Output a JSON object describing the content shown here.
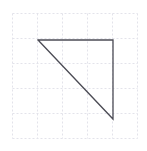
{
  "figure": {
    "canvas": {
      "width": 147,
      "height": 151,
      "background_color": "#ffffff"
    },
    "grid": {
      "visible": true,
      "style": "dashed",
      "color": "#e3e3ea",
      "stroke_width": 1,
      "dash_pattern": "2 2",
      "cell_size": 25,
      "x_start": 12.5,
      "x_end": 137.5,
      "y_start": 13.5,
      "y_end": 138.5,
      "vertical_lines_x": [
        12.5,
        37.5,
        62.5,
        87.5,
        112.5,
        137.5
      ],
      "horizontal_lines_y": [
        13.5,
        38.5,
        63.5,
        88.5,
        113.5,
        138.5
      ],
      "columns": 5,
      "rows": 5
    },
    "shape": {
      "name": "right-triangle",
      "type": "polygon",
      "fill": "none",
      "stroke_color": "#4c4c55",
      "stroke_width": 1.3,
      "vertices": [
        {
          "label": "top-left",
          "x": 38,
          "y": 40
        },
        {
          "label": "top-right",
          "x": 113,
          "y": 40
        },
        {
          "label": "bottom-right",
          "x": 113,
          "y": 119
        }
      ],
      "edges": [
        {
          "label": "top-edge",
          "from": "top-left",
          "to": "top-right",
          "orientation": "horizontal",
          "length_px": 75
        },
        {
          "label": "right-edge",
          "from": "top-right",
          "to": "bottom-right",
          "orientation": "vertical",
          "length_px": 79
        },
        {
          "label": "hypotenuse",
          "from": "bottom-right",
          "to": "top-left",
          "orientation": "diagonal",
          "length_px": 109
        }
      ],
      "right_angle_at": "top-right"
    }
  }
}
